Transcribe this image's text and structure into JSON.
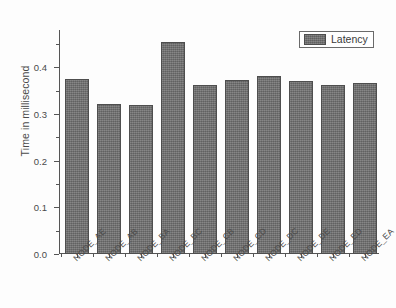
{
  "chart_data": {
    "type": "bar",
    "title": "",
    "xlabel": "",
    "ylabel": "Time in millisecond",
    "ylim": [
      0.0,
      0.48
    ],
    "grid": false,
    "legend_position": "top-right",
    "categories": [
      "NODE_AE",
      "NODE_AB",
      "NODE_BA",
      "NODE_BC",
      "NODE_CB",
      "NODE_CD",
      "NODE_DC",
      "NODE_DE",
      "NODE_ED",
      "NODE_EA"
    ],
    "series": [
      {
        "name": "Latency",
        "color": "#6e6e6e",
        "values": [
          0.375,
          0.322,
          0.319,
          0.455,
          0.362,
          0.373,
          0.382,
          0.37,
          0.362,
          0.366
        ]
      }
    ],
    "y_ticks": [
      {
        "value": 0.0,
        "label": "0.0"
      },
      {
        "value": 0.1,
        "label": "0.1"
      },
      {
        "value": 0.2,
        "label": "0.2"
      },
      {
        "value": 0.3,
        "label": "0.3"
      },
      {
        "value": 0.4,
        "label": "0.4"
      }
    ],
    "y_minor_ticks": [
      0.05,
      0.15,
      0.25,
      0.35,
      0.45
    ]
  },
  "legend": {
    "entries": [
      {
        "label": "Latency",
        "color": "#6e6e6e"
      }
    ]
  },
  "axes": {
    "y_title": "Time in millisecond"
  }
}
